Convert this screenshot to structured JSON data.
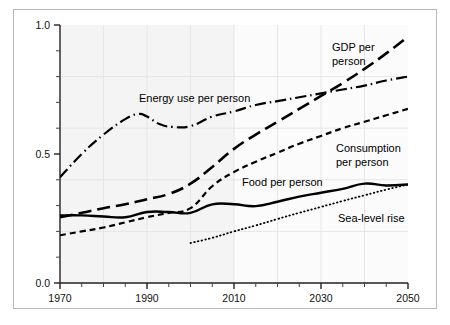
{
  "chart_data": {
    "type": "line",
    "title": "",
    "subtitle": "",
    "xlabel": "",
    "ylabel": "",
    "xlim": [
      1970,
      2050
    ],
    "ylim": [
      0.0,
      1.0
    ],
    "grid": true,
    "grid_style": "faint light-grey major gridlines",
    "legend_position": "inline annotations on curves",
    "x_tick_labels": [
      "1970",
      "1990",
      "2010",
      "2030",
      "2050"
    ],
    "x_major_ticks": [
      1970,
      1990,
      2010,
      2030,
      2050
    ],
    "x_minor_tick_interval": 5,
    "y_tick_labels": [
      "0.0",
      "0.5",
      "1.0"
    ],
    "y_major_ticks": [
      0.0,
      0.5,
      1.0
    ],
    "y_minor_tick_interval": 0.1,
    "background_shading_note": "faint grey panel shading from 1970 to 2010",
    "series": [
      {
        "name": "GDP per person",
        "label": "GDP per person",
        "label_lines": [
          "GDP per",
          "person"
        ],
        "line_style": "long-dash",
        "color": "#000000",
        "x": [
          1970,
          1975,
          1980,
          1985,
          1990,
          1995,
          2000,
          2005,
          2010,
          2015,
          2020,
          2025,
          2030,
          2035,
          2040,
          2045,
          2050
        ],
        "values": [
          0.255,
          0.272,
          0.29,
          0.305,
          0.325,
          0.345,
          0.385,
          0.45,
          0.52,
          0.575,
          0.625,
          0.675,
          0.725,
          0.775,
          0.83,
          0.89,
          0.955
        ]
      },
      {
        "name": "Energy use per person",
        "label": "Energy use per person",
        "label_lines": [
          "Energy use per person"
        ],
        "line_style": "dash-dot",
        "color": "#000000",
        "x": [
          1970,
          1975,
          1980,
          1985,
          1988,
          1990,
          1993,
          1996,
          2000,
          2005,
          2010,
          2015,
          2020,
          2025,
          2030,
          2035,
          2040,
          2045,
          2050
        ],
        "values": [
          0.41,
          0.5,
          0.575,
          0.635,
          0.655,
          0.645,
          0.615,
          0.605,
          0.608,
          0.645,
          0.665,
          0.69,
          0.705,
          0.72,
          0.735,
          0.75,
          0.765,
          0.785,
          0.8
        ]
      },
      {
        "name": "Consumption per person",
        "label": "Consumption per person",
        "label_lines": [
          "Consumption",
          "per person"
        ],
        "line_style": "short-dash",
        "color": "#000000",
        "x": [
          1970,
          1975,
          1980,
          1985,
          1990,
          1995,
          2000,
          2005,
          2010,
          2015,
          2020,
          2025,
          2030,
          2035,
          2040,
          2045,
          2050
        ],
        "values": [
          0.185,
          0.2,
          0.215,
          0.235,
          0.255,
          0.272,
          0.29,
          0.375,
          0.43,
          0.47,
          0.505,
          0.54,
          0.57,
          0.6,
          0.625,
          0.65,
          0.675
        ]
      },
      {
        "name": "Food per person",
        "label": "Food per person",
        "label_lines": [
          "Food per person"
        ],
        "line_style": "solid",
        "color": "#000000",
        "x": [
          1970,
          1975,
          1980,
          1985,
          1990,
          1995,
          2000,
          2005,
          2010,
          2015,
          2020,
          2025,
          2030,
          2035,
          2040,
          2045,
          2050
        ],
        "values": [
          0.262,
          0.262,
          0.258,
          0.255,
          0.275,
          0.275,
          0.272,
          0.305,
          0.305,
          0.298,
          0.315,
          0.335,
          0.35,
          0.365,
          0.385,
          0.378,
          0.382
        ]
      },
      {
        "name": "Sea-level rise",
        "label": "Sea-level rise",
        "label_lines": [
          "Sea-level rise"
        ],
        "line_style": "dotted",
        "color": "#000000",
        "x": [
          2000,
          2005,
          2010,
          2015,
          2020,
          2025,
          2030,
          2035,
          2040,
          2045,
          2050
        ],
        "values": [
          0.155,
          0.175,
          0.2,
          0.223,
          0.248,
          0.272,
          0.295,
          0.318,
          0.34,
          0.362,
          0.382
        ]
      }
    ]
  },
  "annotations": {
    "gdp_line1": "GDP per",
    "gdp_line2": "person",
    "energy": "Energy use per person",
    "consumption_line1": "Consumption",
    "consumption_line2": "per person",
    "food": "Food per person",
    "sealevel": "Sea-level rise"
  },
  "axes": {
    "y_labels": [
      "1.0",
      "0.5",
      "0.0"
    ],
    "x_labels": [
      "1970",
      "1990",
      "2010",
      "2030",
      "2050"
    ]
  }
}
